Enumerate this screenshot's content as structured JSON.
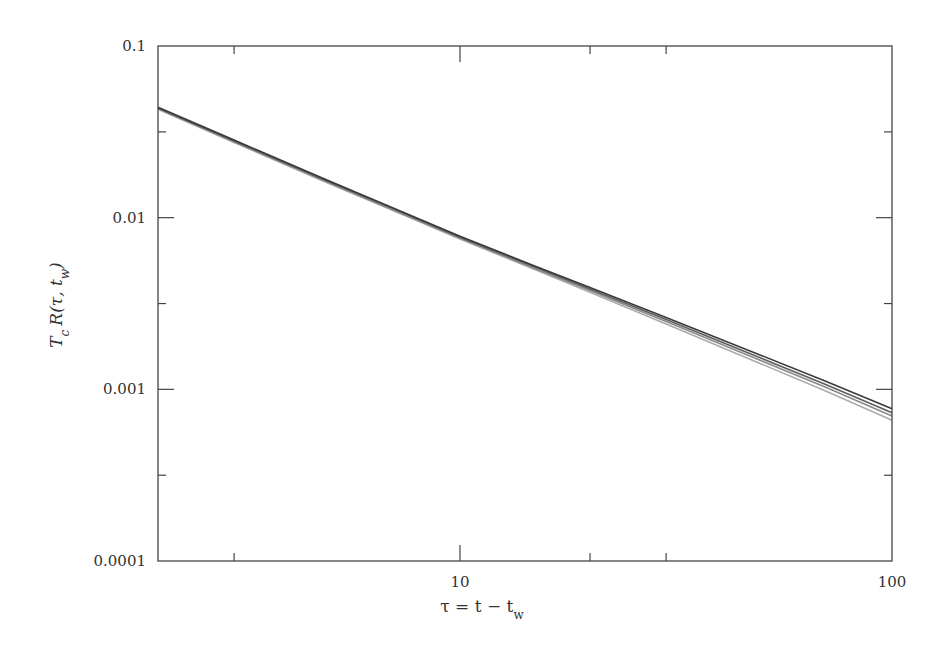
{
  "chart_data": {
    "type": "line",
    "title": "",
    "xlabel": "τ = t − t_w",
    "ylabel": "T_c R(τ, t_w)",
    "xscale": "log",
    "yscale": "log",
    "xlim": [
      2,
      100
    ],
    "ylim": [
      0.0001,
      0.1
    ],
    "grid": false,
    "legend": null,
    "x_ticks": [
      {
        "value": 10,
        "label": "10",
        "major": true
      },
      {
        "value": 100,
        "label": "100",
        "major": true
      },
      {
        "value": 3,
        "label": "",
        "major": false
      },
      {
        "value": 20,
        "label": "",
        "major": false
      },
      {
        "value": 30,
        "label": "",
        "major": false
      }
    ],
    "y_ticks": [
      {
        "value": 0.1,
        "label": "0.1",
        "major": true
      },
      {
        "value": 0.01,
        "label": "0.01",
        "major": true
      },
      {
        "value": 0.001,
        "label": "0.001",
        "major": true
      },
      {
        "value": 0.0001,
        "label": "0.0001",
        "major": true
      },
      {
        "value": 0.0316,
        "label": "",
        "major": false
      },
      {
        "value": 0.00316,
        "label": "",
        "major": false
      },
      {
        "value": 0.000316,
        "label": "",
        "major": false
      }
    ],
    "x": [
      2,
      3,
      5,
      7,
      10,
      15,
      20,
      30,
      50,
      70,
      100
    ],
    "series": [
      {
        "name": "curve-1",
        "color": "#3a3a3a",
        "values": [
          0.044,
          0.0283,
          0.0163,
          0.0114,
          0.0078,
          0.0052,
          0.00392,
          0.00262,
          0.00157,
          0.00112,
          0.00077
        ]
      },
      {
        "name": "curve-2",
        "color": "#5e5e5e",
        "values": [
          0.0436,
          0.028,
          0.0161,
          0.0113,
          0.0077,
          0.00512,
          0.00384,
          0.00255,
          0.00151,
          0.00107,
          0.00073
        ]
      },
      {
        "name": "curve-3",
        "color": "#8a8a8a",
        "values": [
          0.0432,
          0.0277,
          0.0159,
          0.0111,
          0.0076,
          0.00503,
          0.00376,
          0.00248,
          0.00146,
          0.00103,
          0.0007
        ]
      },
      {
        "name": "curve-4",
        "color": "#ababab",
        "values": [
          0.0428,
          0.0274,
          0.0157,
          0.011,
          0.0075,
          0.00495,
          0.00368,
          0.0024,
          0.0014,
          0.00098,
          0.00066
        ]
      }
    ]
  },
  "axes": {
    "x_label_main": "τ = t − t",
    "x_label_sub": "w",
    "y_label_main_T": "T",
    "y_label_sub_c": "c",
    "y_label_main_R": "R(τ, t",
    "y_label_sub_w": "w",
    "y_label_close": ")"
  }
}
